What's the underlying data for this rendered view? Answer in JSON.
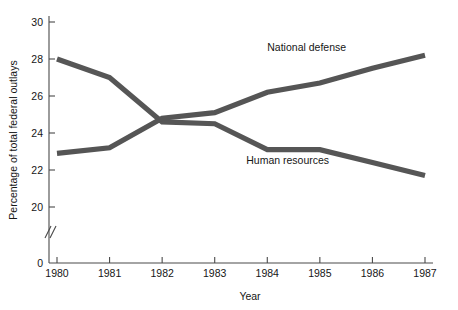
{
  "chart_data": {
    "type": "line",
    "title": "",
    "xlabel": "Year",
    "ylabel": "Percentage of total federal outlays",
    "x": [
      1980,
      1981,
      1982,
      1983,
      1984,
      1985,
      1986,
      1987
    ],
    "xtick_labels": [
      "1980",
      "1981",
      "1982",
      "1983",
      "1984",
      "1985",
      "1986",
      "1987"
    ],
    "ytick_labels": [
      "0",
      "20",
      "22",
      "24",
      "26",
      "28",
      "30"
    ],
    "ytick_values": [
      0,
      20,
      22,
      24,
      26,
      28,
      30
    ],
    "ylim": [
      20,
      30
    ],
    "xlim": [
      1980,
      1987
    ],
    "grid": false,
    "y_axis_break": true,
    "y_axis_break_symbol": "//",
    "legend_position": "inline-annotations",
    "series": [
      {
        "name": "Human resources",
        "color": "#565656",
        "values": [
          28.0,
          27.0,
          24.6,
          24.5,
          23.1,
          23.1,
          22.4,
          21.7
        ],
        "label_x": 1983.6,
        "label_y": 22.35
      },
      {
        "name": "National defense",
        "color": "#555555",
        "values": [
          22.9,
          23.2,
          24.8,
          25.1,
          26.2,
          26.7,
          27.5,
          28.2
        ],
        "label_x": 1984.0,
        "label_y": 28.45
      }
    ]
  },
  "axes": {
    "y_title": "Percentage of total federal outlays",
    "x_title": "Year"
  }
}
